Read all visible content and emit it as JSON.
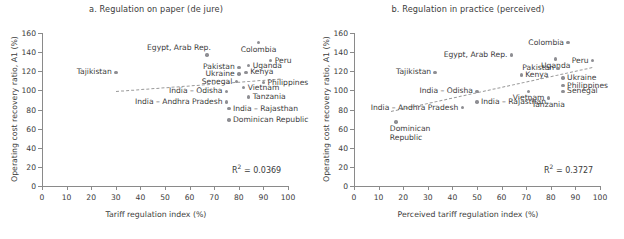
{
  "figure": {
    "width": 624,
    "height": 239,
    "dot_color": "#8e8e93",
    "axis_color": "#8a8a8a",
    "trend_color": "#9a9a9a"
  },
  "axis": {
    "y_label": "Operating cost recovery ratio, A1 (%)",
    "y_ticks": [
      "0",
      "20",
      "40",
      "60",
      "80",
      "100",
      "120",
      "140",
      "160"
    ],
    "y_min": 0,
    "y_max": 160,
    "x_ticks": [
      "0",
      "10",
      "20",
      "30",
      "40",
      "50",
      "60",
      "70",
      "80",
      "90",
      "100"
    ],
    "x_min": 0,
    "x_max": 100
  },
  "chart_data": [
    {
      "type": "scatter",
      "panel": "a",
      "title": "a. Regulation on paper (de jure)",
      "xlabel": "Tariff regulation index (%)",
      "ylabel": "Operating cost recovery ratio, A1 (%)",
      "xlim": [
        0,
        100
      ],
      "ylim": [
        0,
        160
      ],
      "grid": false,
      "r2_label": "R² = 0.0369",
      "r2": 0.0369,
      "trendline": {
        "x1": 30,
        "y1": 99,
        "x2": 97,
        "y2": 112
      },
      "points": [
        {
          "name": "Tajikistan",
          "x": 30,
          "y": 119,
          "pos": "r"
        },
        {
          "name": "Egypt, Arab Rep.",
          "x": 67,
          "y": 137,
          "pos": "up-left"
        },
        {
          "name": "Colombia",
          "x": 88,
          "y": 150,
          "pos": "below"
        },
        {
          "name": "Peru",
          "x": 93,
          "y": 131,
          "pos": "l"
        },
        {
          "name": "Uganda",
          "x": 84,
          "y": 126,
          "pos": "l"
        },
        {
          "name": "Pakistan",
          "x": 80,
          "y": 124,
          "pos": "r"
        },
        {
          "name": "Kenya",
          "x": 83,
          "y": 119,
          "pos": "l"
        },
        {
          "name": "Ukraine",
          "x": 80,
          "y": 117,
          "pos": "r"
        },
        {
          "name": "Philippines",
          "x": 90,
          "y": 108,
          "pos": "l"
        },
        {
          "name": "Senegal",
          "x": 79,
          "y": 109,
          "pos": "r"
        },
        {
          "name": "Vietnam",
          "x": 82,
          "y": 103,
          "pos": "l"
        },
        {
          "name": "India – Odisha",
          "x": 75,
          "y": 99,
          "pos": "r"
        },
        {
          "name": "Tanzania",
          "x": 84,
          "y": 93,
          "pos": "l"
        },
        {
          "name": "India – Andhra Pradesh",
          "x": 75,
          "y": 88,
          "pos": "r"
        },
        {
          "name": "India – Rajasthan",
          "x": 76,
          "y": 81,
          "pos": "l"
        },
        {
          "name": "Dominican Republic",
          "x": 76,
          "y": 69,
          "pos": "l"
        }
      ]
    },
    {
      "type": "scatter",
      "panel": "b",
      "title": "b. Regulation in practice (perceived)",
      "xlabel": "Perceived tariff regulation index (%)",
      "ylabel": "Operating cost recovery ratio, A1 (%)",
      "xlim": [
        0,
        100
      ],
      "ylim": [
        0,
        160
      ],
      "grid": false,
      "r2_label": "R² = 0.3727",
      "r2": 0.3727,
      "trendline": {
        "x1": 15,
        "y1": 78,
        "x2": 97,
        "y2": 124
      },
      "points": [
        {
          "name": "Tajikistan",
          "x": 33,
          "y": 119,
          "pos": "r"
        },
        {
          "name": "Egypt, Arab Rep.",
          "x": 64,
          "y": 137,
          "pos": "r"
        },
        {
          "name": "Colombia",
          "x": 87,
          "y": 150,
          "pos": "r"
        },
        {
          "name": "Peru",
          "x": 97,
          "y": 131,
          "pos": "r"
        },
        {
          "name": "Uganda",
          "x": 82,
          "y": 133,
          "pos": "below"
        },
        {
          "name": "Pakistan",
          "x": 83,
          "y": 123,
          "pos": "r"
        },
        {
          "name": "Kenya",
          "x": 68,
          "y": 116,
          "pos": "l"
        },
        {
          "name": "Ukraine",
          "x": 85,
          "y": 113,
          "pos": "l"
        },
        {
          "name": "Philippines",
          "x": 85,
          "y": 105,
          "pos": "l"
        },
        {
          "name": "Senegal",
          "x": 85,
          "y": 99,
          "pos": "l"
        },
        {
          "name": "Vietnam",
          "x": 71,
          "y": 99,
          "pos": "below"
        },
        {
          "name": "India – Odisha",
          "x": 50,
          "y": 99,
          "pos": "r"
        },
        {
          "name": "Tanzania",
          "x": 79,
          "y": 92,
          "pos": "below"
        },
        {
          "name": "India – Rajasthan",
          "x": 50,
          "y": 88,
          "pos": "l"
        },
        {
          "name": "India – Andhra Pradesh",
          "x": 44,
          "y": 82,
          "pos": "r"
        },
        {
          "name": "Dominican Republic",
          "x": 17,
          "y": 67,
          "pos": "below-left"
        }
      ]
    }
  ]
}
